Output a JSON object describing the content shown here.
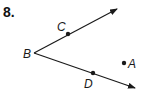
{
  "problem": {
    "number": "8."
  },
  "diagram": {
    "vertex": {
      "label": "B",
      "x": 34,
      "y": 53
    },
    "rays": [
      {
        "name": "ray-BC",
        "from": "B",
        "through": "C",
        "end": {
          "x": 117,
          "y": 9
        }
      },
      {
        "name": "ray-BD",
        "from": "B",
        "through": "D",
        "end": {
          "x": 135,
          "y": 88
        }
      }
    ],
    "points": [
      {
        "label": "C",
        "x": 68,
        "y": 34
      },
      {
        "label": "D",
        "x": 93,
        "y": 73
      },
      {
        "label": "A",
        "x": 124,
        "y": 63
      }
    ],
    "labels": {
      "B": "B",
      "C": "C",
      "D": "D",
      "A": "A"
    },
    "colors": {
      "stroke": "#1a1a1a",
      "background": "#ffffff"
    }
  }
}
